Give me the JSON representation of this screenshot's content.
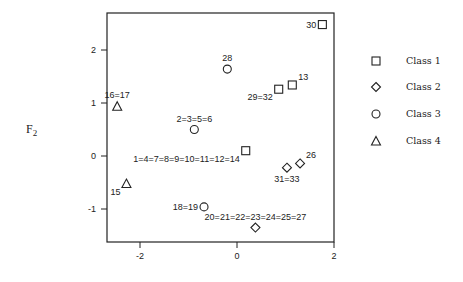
{
  "chart_data": {
    "type": "scatter",
    "title": "",
    "xlabel": "",
    "ylabel": "F2",
    "xlim": [
      -2.7,
      2.0
    ],
    "ylim": [
      -1.6,
      2.7
    ],
    "x_ticks": [
      -2,
      0,
      2
    ],
    "y_ticks": [
      2,
      1,
      0,
      -1
    ],
    "grid": false,
    "legend_position": "right",
    "series": [
      {
        "name": "Class 1",
        "marker": "square",
        "points": [
          {
            "x": 1.76,
            "y": 2.48,
            "label": "30",
            "label_pos": "left"
          },
          {
            "x": 1.14,
            "y": 1.34,
            "label": "13",
            "label_pos": "upper-right"
          },
          {
            "x": 0.86,
            "y": 1.26,
            "label": "29=32",
            "label_pos": "lower-left"
          },
          {
            "x": 0.18,
            "y": 0.1,
            "label": "1=4=7=8=9=10=11=12=14",
            "label_pos": "lower-left"
          }
        ]
      },
      {
        "name": "Class 2",
        "marker": "diamond",
        "points": [
          {
            "x": 1.3,
            "y": -0.14,
            "label": "26",
            "label_pos": "upper-right"
          },
          {
            "x": 1.03,
            "y": -0.22,
            "label": "31=33",
            "label_pos": "below"
          },
          {
            "x": 0.38,
            "y": -1.35,
            "label": "20=21=22=23=24=25=27",
            "label_pos": "above"
          }
        ]
      },
      {
        "name": "Class 3",
        "marker": "circle",
        "points": [
          {
            "x": -0.2,
            "y": 1.64,
            "label": "28",
            "label_pos": "above"
          },
          {
            "x": -0.88,
            "y": 0.5,
            "label": "2=3=5=6",
            "label_pos": "above"
          },
          {
            "x": -0.68,
            "y": -0.96,
            "label": "18=19",
            "label_pos": "left"
          }
        ]
      },
      {
        "name": "Class 4",
        "marker": "triangle",
        "points": [
          {
            "x": -2.47,
            "y": 0.94,
            "label": "16=17",
            "label_pos": "above"
          },
          {
            "x": -2.28,
            "y": -0.52,
            "label": "15",
            "label_pos": "lower-left"
          }
        ]
      }
    ]
  },
  "axis": {
    "y_label_main": "F",
    "y_label_sub": "2",
    "x_tick_labels": [
      "-2",
      "0",
      "2"
    ],
    "y_tick_labels": [
      "2",
      "1",
      "0",
      "-1"
    ]
  },
  "legend": {
    "items": [
      {
        "label": "Class 1",
        "marker": "square"
      },
      {
        "label": "Class 2",
        "marker": "diamond"
      },
      {
        "label": "Class 3",
        "marker": "circle"
      },
      {
        "label": "Class 4",
        "marker": "triangle"
      }
    ]
  },
  "colors": {
    "ink": "#222222",
    "background": "#ffffff"
  }
}
